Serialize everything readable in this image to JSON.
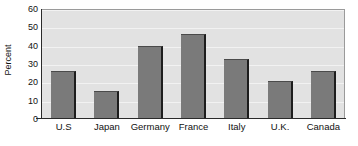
{
  "chart_data": {
    "type": "bar",
    "title": "",
    "xlabel": "",
    "ylabel": "Percent",
    "categories": [
      "U.S",
      "Japan",
      "Germany",
      "France",
      "Italy",
      "U.K.",
      "Canada"
    ],
    "values": [
      26,
      15.5,
      40,
      46.5,
      33,
      20.5,
      26
    ],
    "ylim": [
      0,
      60
    ],
    "yticks": [
      0,
      10,
      20,
      30,
      40,
      50,
      60
    ],
    "ytick_labels": [
      "0",
      "10",
      "20",
      "30",
      "40",
      "50",
      "60"
    ],
    "grid": true,
    "legend": false,
    "colors": {
      "bar_fill": "#7a7a7a",
      "bar_edge": "#1d1d1d",
      "plot_background": "#e2e2e2",
      "gridline": "#f2f2f2",
      "axis": "#2a2a2a",
      "text": "#111111",
      "page_background": "#ffffff"
    }
  }
}
